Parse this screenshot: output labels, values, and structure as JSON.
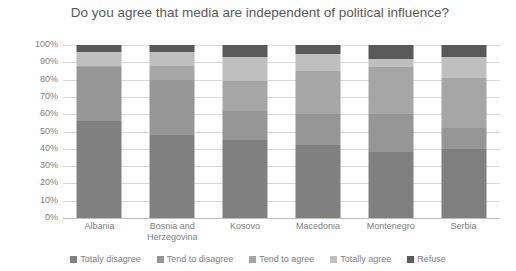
{
  "chart_data": {
    "type": "bar",
    "subtype": "stacked-percent",
    "title": "Do you agree that media are independent of political influence?",
    "xlabel": "",
    "ylabel": "",
    "ylim": [
      0,
      100
    ],
    "ytick_labels": [
      "100%",
      "90%",
      "80%",
      "70%",
      "60%",
      "50%",
      "40%",
      "30%",
      "20%",
      "10%",
      "0%"
    ],
    "ytick_values": [
      100,
      90,
      80,
      70,
      60,
      50,
      40,
      30,
      20,
      10,
      0
    ],
    "grid": true,
    "legend_position": "bottom",
    "categories": [
      "Albania",
      "Bosnia and Herzegovina",
      "Kosovo",
      "Macedonia",
      "Montenegro",
      "Serbia"
    ],
    "series": [
      {
        "name": "Totaly disagree",
        "color": "#808080",
        "values": [
          56,
          48,
          45,
          42,
          38,
          40
        ]
      },
      {
        "name": "Tend to disagree",
        "color": "#969696",
        "values": [
          31,
          32,
          17,
          18,
          22,
          12
        ]
      },
      {
        "name": "Tend to agree",
        "color": "#a6a6a6",
        "values": [
          1,
          8,
          17,
          25,
          27,
          29
        ]
      },
      {
        "name": "Totally agree",
        "color": "#bfbfbf",
        "values": [
          8,
          8,
          14,
          10,
          5,
          12
        ]
      },
      {
        "name": "Refuse",
        "color": "#595959",
        "values": [
          4,
          4,
          7,
          5,
          8,
          7
        ]
      }
    ]
  },
  "colors": {
    "title_text": "#595959",
    "tick_text": "#808080",
    "gridline": "#d9d9d9",
    "background": "#ffffff"
  }
}
